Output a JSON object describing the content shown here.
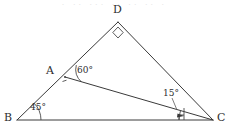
{
  "figure": {
    "type": "geometry-diagram",
    "canvas": {
      "width": 229,
      "height": 134
    },
    "vertices": [
      {
        "id": "B",
        "label": "B",
        "x": 17,
        "y": 120,
        "label_x": 4,
        "label_y": 112
      },
      {
        "id": "D",
        "label": "D",
        "x": 118,
        "y": 22,
        "label_x": 113,
        "label_y": 5
      },
      {
        "id": "C",
        "label": "C",
        "x": 213,
        "y": 120,
        "label_x": 217,
        "label_y": 112
      },
      {
        "id": "A",
        "label": "A",
        "x": 65,
        "y": 77,
        "label_x": 46,
        "label_y": 65
      }
    ],
    "segments": [
      {
        "id": "BD",
        "from": "B",
        "to": "D"
      },
      {
        "id": "DC",
        "from": "D",
        "to": "C"
      },
      {
        "id": "BC",
        "from": "B",
        "to": "C"
      },
      {
        "id": "AC",
        "from": "A",
        "to": "C"
      }
    ],
    "angles": [
      {
        "id": "angle-B",
        "vertex": "B",
        "label": "45°",
        "value": 45,
        "label_x": 28,
        "label_y": 103
      },
      {
        "id": "angle-A",
        "vertex": "A",
        "label": "60°",
        "value": 60,
        "label_x": 75,
        "label_y": 66
      },
      {
        "id": "angle-C",
        "vertex": "C",
        "label": "15°",
        "value": 15,
        "label_x": 163,
        "label_y": 91
      },
      {
        "id": "angle-D",
        "vertex": "D",
        "label": "",
        "value": 90,
        "label_x": 0,
        "label_y": 0
      }
    ],
    "right_angle_marks": [
      {
        "id": "right-angle-D",
        "at": "D",
        "style": "square-diamond"
      },
      {
        "id": "right-angle-foot-bc",
        "at": "BC near C",
        "style": "small-square"
      }
    ],
    "colors": {
      "line": "#3a3a3a",
      "mark": "#4a4a4a",
      "text": "#2e2e2e",
      "background": "#ffffff"
    },
    "top_artifact": "· ·· ··· ·· ·· ·· ·"
  }
}
